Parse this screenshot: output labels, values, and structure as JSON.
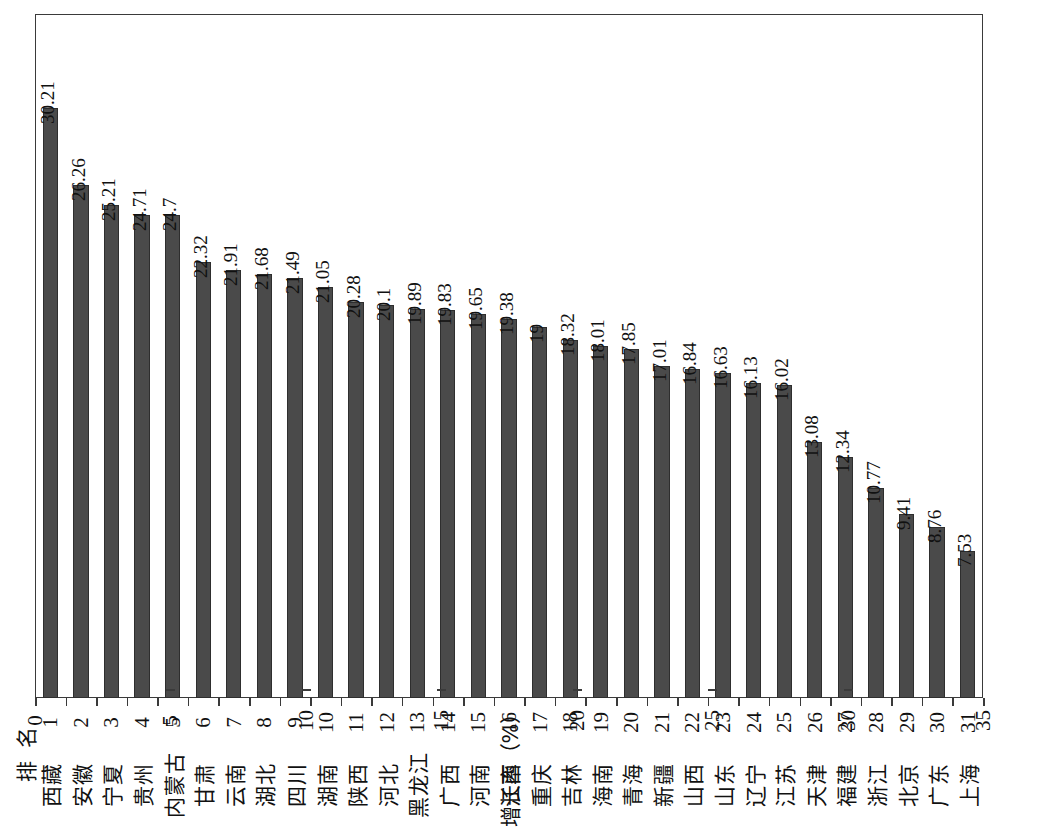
{
  "chart_data": {
    "type": "bar",
    "orientation": "vertical-rotated-90ccw",
    "title": "",
    "xlabel": "排 名",
    "ylabel": "增长率（%）",
    "ylim": [
      0,
      35
    ],
    "y_ticks": [
      0,
      5,
      10,
      15,
      20,
      25,
      30,
      35
    ],
    "grid": false,
    "legend": null,
    "bar_color": "#4a4a4a",
    "frame_color": "#3a3a3a",
    "ranks": [
      "1",
      "2",
      "3",
      "4",
      "5",
      "6",
      "7",
      "8",
      "9",
      "10",
      "11",
      "12",
      "13",
      "14",
      "15",
      "16",
      "17",
      "18",
      "19",
      "20",
      "21",
      "22",
      "23",
      "24",
      "25",
      "26",
      "27",
      "28",
      "29",
      "30",
      "31"
    ],
    "categories": [
      "西藏",
      "安徽",
      "宁夏",
      "贵州",
      "内蒙古",
      "甘肃",
      "云南",
      "湖北",
      "四川",
      "湖南",
      "陕西",
      "河北",
      "黑龙江",
      "广西",
      "河南",
      "江西",
      "重庆",
      "吉林",
      "海南",
      "青海",
      "新疆",
      "山西",
      "山东",
      "辽宁",
      "江苏",
      "天津",
      "福建",
      "浙江",
      "北京",
      "广东",
      "上海"
    ],
    "values": [
      30.21,
      26.26,
      25.21,
      24.71,
      24.7,
      22.32,
      21.91,
      21.68,
      21.49,
      21.05,
      20.28,
      20.1,
      19.89,
      19.83,
      19.65,
      19.38,
      19,
      18.32,
      18.01,
      17.85,
      17.01,
      16.84,
      16.63,
      16.13,
      16.02,
      13.08,
      12.34,
      10.77,
      9.41,
      8.76,
      7.53
    ],
    "value_labels": [
      "30.21",
      "26.26",
      "25.21",
      "24.71",
      "24.7",
      "22.32",
      "21.91",
      "21.68",
      "21.49",
      "21.05",
      "20.28",
      "20.1",
      "19.89",
      "19.83",
      "19.65",
      "19.38",
      "19",
      "18.32",
      "18.01",
      "17.85",
      "17.01",
      "16.84",
      "16.63",
      "16.13",
      "16.02",
      "13.08",
      "12.34",
      "10.77",
      "9.41",
      "8.76",
      "7.53"
    ],
    "y_tick_labels": [
      "0",
      "5",
      "10",
      "15",
      "20",
      "25",
      "30",
      "35"
    ]
  }
}
